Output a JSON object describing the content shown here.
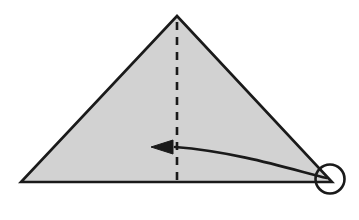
{
  "figure": {
    "title": "Origami fold step diagram",
    "description": "A shaded triangle with a vertical dashed fold line from the apex to the base, and a curved arrow sweeping from the bottom-right corner toward the fold line.",
    "background_color": "#ffffff"
  },
  "shapes": {
    "triangle": {
      "name": "folded paper triangle",
      "fill_color": "#d2d2d2",
      "stroke_color": "#1a1a1a",
      "stroke_width": 2.6,
      "points": "177,16 332,182 21,182",
      "apex": {
        "x": 177,
        "y": 16
      },
      "bottom_left": {
        "x": 21,
        "y": 182
      },
      "bottom_right": {
        "x": 332,
        "y": 182
      }
    },
    "fold_line": {
      "name": "vertical dashed fold line",
      "stroke_color": "#1a1a1a",
      "stroke_width": 2.6,
      "dash_pattern": "8 7",
      "x": 177,
      "y_start": 22,
      "y_end": 186
    },
    "fold_arrow": {
      "name": "curved fold direction arrow",
      "stroke_color": "#1a1a1a",
      "stroke_width": 2.6,
      "path": "M 327,178 C 300,172 240,152 175,147",
      "start": {
        "x": 327,
        "y": 178
      },
      "end": {
        "x": 175,
        "y": 147
      },
      "direction": "right-to-left"
    },
    "arrow_head": {
      "name": "solid triangular arrowhead",
      "fill_color": "#1a1a1a",
      "points": "151,147 173,140 173,154",
      "tip": {
        "x": 151,
        "y": 147
      }
    },
    "corner_circle": {
      "name": "circled bottom-right corner marker",
      "stroke_color": "#1a1a1a",
      "stroke_width": 2.6,
      "fill": "none",
      "center": {
        "x": 330,
        "y": 179
      },
      "radius": 14.5
    }
  },
  "labels": {
    "triangle": "Shaded triangular paper",
    "fold_line": "Dashed vertical fold line",
    "arrow": "Fold arrow pointing left",
    "circle": "Highlighted corner to fold"
  }
}
